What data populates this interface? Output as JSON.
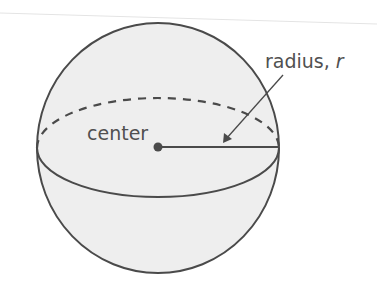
{
  "diagram": {
    "labels": {
      "center": "center",
      "radius_word": "radius, ",
      "radius_var": "r"
    },
    "colors": {
      "stroke": "#4a4a4a",
      "fill": "#eeeeee",
      "text": "#505050"
    }
  }
}
